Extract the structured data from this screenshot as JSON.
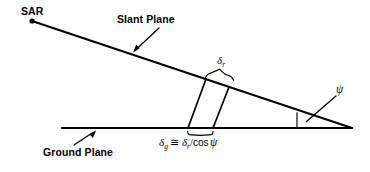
{
  "figure": {
    "background_color": "#ffffff",
    "stroke_color": "#000000",
    "width": 370,
    "height": 172
  },
  "labels": {
    "sar": "SAR",
    "slant_plane": "Slant Plane",
    "ground_plane": "Ground Plane",
    "delta_r_symbol": "δ",
    "delta_r_subscript": "r",
    "delta_g_symbol": "δ",
    "delta_g_subscript": "g",
    "approx_equal": "≅",
    "divider": "/",
    "cosine": "cos",
    "psi": "ψ",
    "formula_plain": "δg ≅ δr/cos ψ"
  },
  "geometry": {
    "sar_point": {
      "x": 32,
      "y": 21
    },
    "apex_point": {
      "x": 352,
      "y": 128
    },
    "ground_start": {
      "x": 62,
      "y": 128
    },
    "slant_cell_left": {
      "x1": 206,
      "y1": 79,
      "x2": 188,
      "y2": 128
    },
    "slant_cell_right": {
      "x1": 229,
      "y1": 87,
      "x2": 213,
      "y2": 128
    },
    "grazing_angle_label": "ψ"
  },
  "annotations": {
    "slant_arrow": {
      "from_x": 159,
      "from_y": 29,
      "to_x": 134,
      "to_y": 52
    },
    "ground_arrow": {
      "from_x": 74,
      "from_y": 145,
      "to_x": 95,
      "to_y": 131
    },
    "psi_leader": {
      "from_x": 336,
      "from_y": 95,
      "to_x": 307,
      "to_y": 121
    }
  }
}
